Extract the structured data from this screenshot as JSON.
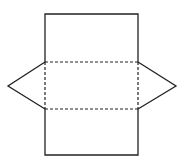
{
  "diagram": {
    "type": "net-of-triangular-prism",
    "stroke_color": "#222222",
    "background": "#ffffff",
    "rectangle": {
      "x": 45,
      "y": 14,
      "width": 93,
      "height": 141
    },
    "fold_lines": [
      {
        "x1": 45,
        "y1": 62,
        "x2": 138,
        "y2": 62
      },
      {
        "x1": 45,
        "y1": 109,
        "x2": 138,
        "y2": 109
      }
    ],
    "dashed_sides": [
      {
        "x1": 45,
        "y1": 62,
        "x2": 45,
        "y2": 109
      },
      {
        "x1": 138,
        "y1": 62,
        "x2": 138,
        "y2": 109
      }
    ],
    "triangles": [
      {
        "side": "left",
        "points": "45,62 8,86 45,109"
      },
      {
        "side": "right",
        "points": "138,62 176,86 138,109"
      }
    ]
  }
}
